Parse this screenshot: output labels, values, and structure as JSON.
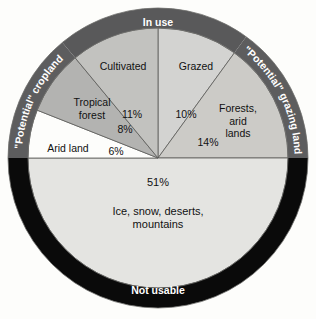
{
  "figure": {
    "background_color": "#fdfdfb"
  },
  "chart_data": {
    "type": "pie",
    "title": "",
    "subtitle": "",
    "xlabel": "",
    "ylabel": "",
    "legend_position": "none",
    "grid": false,
    "units": "percent of total land area",
    "center": {
      "x": 158,
      "y": 158
    },
    "outer_radius": 150,
    "inner_radius": 130,
    "start_angle_deg": 0,
    "direction": "clockwise",
    "categories": [
      "Grazed",
      "Forests, arid lands",
      "Ice, snow, deserts, mountains",
      "Arid land",
      "Tropical forest",
      "Cultivated"
    ],
    "values": [
      10,
      14,
      51,
      6,
      8,
      11
    ],
    "slices": [
      {
        "name": "grazed",
        "label": "Grazed",
        "label_lines": [
          "Grazed"
        ],
        "value": 10,
        "pct_label": "10%",
        "color": "#d3d3d1",
        "start_deg": 0,
        "end_deg": 36,
        "label_x": 196,
        "label_y": 70,
        "pct_x": 186,
        "pct_y": 118
      },
      {
        "name": "forests-arid-lands",
        "label": "Forests, arid lands",
        "label_lines": [
          "Forests,",
          "arid",
          "lands"
        ],
        "value": 14,
        "pct_label": "14%",
        "color": "#cccbc7",
        "start_deg": 36,
        "end_deg": 90,
        "label_x": 238,
        "label_y": 112,
        "pct_x": 208,
        "pct_y": 146
      },
      {
        "name": "ice-snow-deserts-mountains",
        "label": "Ice, snow, deserts, mountains",
        "label_lines": [
          "Ice, snow, deserts,",
          "mountains"
        ],
        "value": 51,
        "pct_label": "51%",
        "color": "#e4e4e1",
        "start_deg": 90,
        "end_deg": 270,
        "label_x": 158,
        "label_y": 215,
        "pct_x": 158,
        "pct_y": 186
      },
      {
        "name": "arid-land",
        "label": "Arid land",
        "label_lines": [
          "Arid land"
        ],
        "value": 6,
        "pct_label": "6%",
        "color": "#fdfdfb",
        "start_deg": 270,
        "end_deg": 291.6,
        "label_x": 68,
        "label_y": 152,
        "pct_x": 116,
        "pct_y": 155
      },
      {
        "name": "tropical-forest",
        "label": "Tropical forest",
        "label_lines": [
          "Tropical",
          "forest"
        ],
        "value": 8,
        "pct_label": "8%",
        "color": "#b3b3b1",
        "start_deg": 291.6,
        "end_deg": 320.4,
        "label_x": 92,
        "label_y": 106,
        "pct_x": 125,
        "pct_y": 133
      },
      {
        "name": "cultivated",
        "label": "Cultivated",
        "label_lines": [
          "Cultivated"
        ],
        "value": 11,
        "pct_label": "11%",
        "color": "#c2c2bf",
        "start_deg": 320.4,
        "end_deg": 360,
        "label_x": 123,
        "label_y": 70,
        "pct_x": 132,
        "pct_y": 118
      }
    ],
    "ring_segments": [
      {
        "name": "in-use",
        "label": "In use",
        "color": "#59595a",
        "start_deg": 320.4,
        "end_deg": 36,
        "text_mode": "straight",
        "text_x": 158,
        "text_y": 26
      },
      {
        "name": "potential-grazing-land",
        "label": "\"Potential\" grazing land",
        "color": "#5d5d5e",
        "start_deg": 36,
        "end_deg": 90,
        "text_mode": "curved",
        "path_start_deg": 39,
        "path_end_deg": 88
      },
      {
        "name": "potential-cropland",
        "label": "\"Potential\" cropland",
        "color": "#5d5d5e",
        "start_deg": 270,
        "end_deg": 320.4,
        "text_mode": "curved",
        "path_start_deg": 272,
        "path_end_deg": 318
      },
      {
        "name": "not-usable",
        "label": "Not usable",
        "color": "#0a0a0a",
        "start_deg": 90,
        "end_deg": 270,
        "text_mode": "straight",
        "text_x": 158,
        "text_y": 294
      }
    ],
    "separator_color": "#5a5a58",
    "outline_color": "#6e6e6c"
  }
}
